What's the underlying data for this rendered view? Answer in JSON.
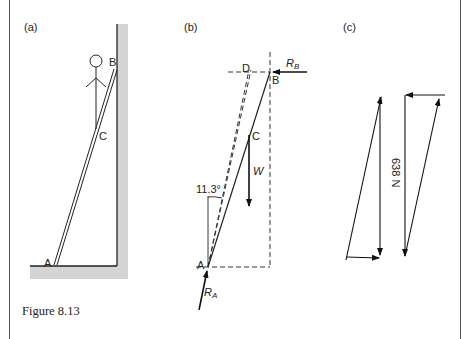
{
  "caption": "Figure 8.13",
  "panels": {
    "a": {
      "label": "(a)",
      "points": {
        "A": "A",
        "B": "B",
        "C": "C"
      }
    },
    "b": {
      "label": "(b)",
      "points": {
        "A": "A",
        "B": "B",
        "C": "C",
        "D": "D"
      },
      "forces": {
        "RB": "R",
        "RB_sub": "B",
        "RA": "R",
        "RA_sub": "A",
        "W": "W"
      },
      "angle": "11.3°"
    },
    "c": {
      "label": "(c)",
      "magnitude": "638 N"
    }
  }
}
